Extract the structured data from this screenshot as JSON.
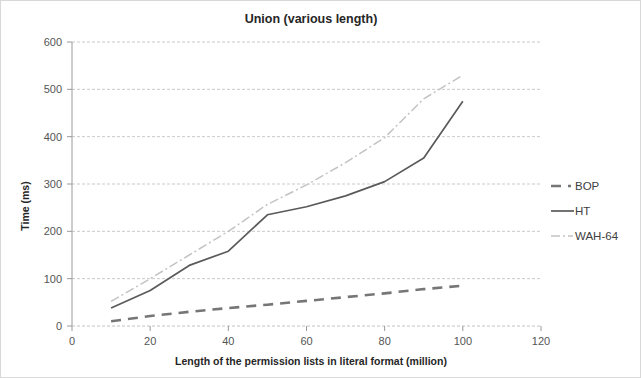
{
  "chart_data": {
    "type": "line",
    "title": "Union (various length)",
    "xlabel": "Length of the permission lists  in literal format (million)",
    "ylabel": "Time (ms)",
    "xlim": [
      0,
      120
    ],
    "ylim": [
      0,
      600
    ],
    "xticks": [
      "0",
      "20",
      "40",
      "60",
      "80",
      "100",
      "120"
    ],
    "yticks": [
      "0",
      "100",
      "200",
      "300",
      "400",
      "500",
      "600"
    ],
    "grid": "horizontal",
    "legend_position": "right",
    "x": [
      10,
      20,
      30,
      40,
      50,
      60,
      70,
      80,
      90,
      100
    ],
    "series": [
      {
        "name": "BOP",
        "style": "dashed",
        "color": "#767676",
        "values": [
          10,
          21,
          30,
          38,
          45,
          53,
          61,
          69,
          78,
          85
        ]
      },
      {
        "name": "HT",
        "style": "solid",
        "color": "#5a5a5a",
        "values": [
          38,
          75,
          128,
          158,
          235,
          252,
          275,
          305,
          355,
          475
        ]
      },
      {
        "name": "WAH-64",
        "style": "dash-dot",
        "color": "#c3c3c3",
        "values": [
          52,
          100,
          150,
          200,
          257,
          298,
          345,
          398,
          480,
          530
        ]
      }
    ]
  },
  "legend": {
    "items": [
      {
        "label": "BOP"
      },
      {
        "label": "HT"
      },
      {
        "label": "WAH-64"
      }
    ]
  }
}
